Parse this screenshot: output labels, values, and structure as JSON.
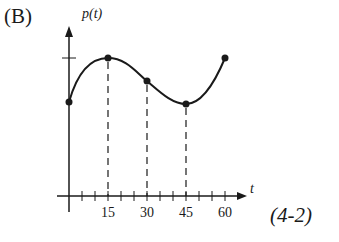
{
  "figure": {
    "panel_label": "(B)",
    "figure_id": "(4-2)"
  },
  "chart_data": {
    "type": "line",
    "title": "",
    "xlabel": "t",
    "ylabel": "p(t)",
    "x_ticks": [
      "15",
      "30",
      "45",
      "60"
    ],
    "x_tick_values": [
      15,
      30,
      45,
      60
    ],
    "minor_tick_step": 5,
    "xlim": [
      0,
      60
    ],
    "grid": false,
    "legend": null,
    "series": [
      {
        "name": "p(t)",
        "x": [
          0,
          15,
          30,
          45,
          60
        ],
        "y_relative": [
          0.56,
          1.0,
          0.77,
          0.54,
          1.0
        ],
        "marked_points": true,
        "description": "Local max at t=15, decreasing through t=30, local min at t=45, increasing to t=60"
      }
    ],
    "annotations": [
      {
        "type": "dashed-vertical",
        "x": 15
      },
      {
        "type": "dashed-vertical",
        "x": 30
      },
      {
        "type": "dashed-vertical",
        "x": 45
      },
      {
        "type": "y-axis-tick",
        "at": "max level"
      }
    ]
  }
}
